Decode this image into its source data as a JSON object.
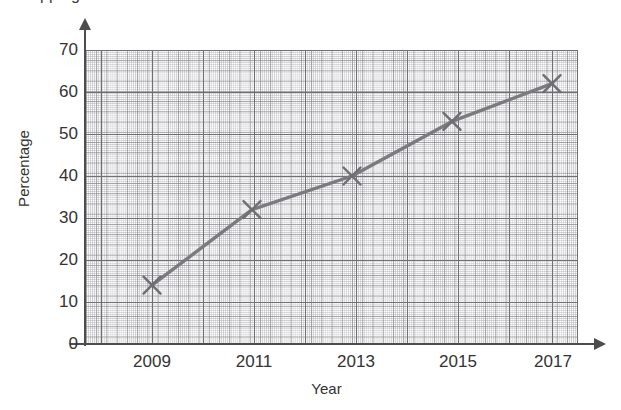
{
  "title": "...pping ... ...",
  "axis": {
    "ylabel": "Percentage",
    "xlabel": "Year"
  },
  "yticks": [
    "0",
    "10",
    "20",
    "30",
    "40",
    "50",
    "60",
    "70"
  ],
  "xticks": [
    "2009",
    "2011",
    "2013",
    "2015",
    "2017"
  ],
  "colors": {
    "line": "#7a7a7f",
    "marker": "#6e6e73",
    "axis": "#4d4d4d",
    "grid_major": "#6f6f74",
    "grid_minor": "#96969e",
    "text": "#333333"
  },
  "chart_data": {
    "type": "line",
    "title": "",
    "xlabel": "Year",
    "ylabel": "Percentage",
    "x": [
      2009,
      2011,
      2013,
      2015,
      2017
    ],
    "xtick_labels": [
      "2009",
      "2011",
      "2013",
      "2015",
      "2017"
    ],
    "values": [
      14,
      32,
      40,
      53,
      62
    ],
    "series": [
      {
        "name": "Percentage",
        "values": [
          14,
          32,
          40,
          53,
          62
        ]
      }
    ],
    "ylim": [
      0,
      70
    ],
    "ytick_labels": [
      "0",
      "10",
      "20",
      "30",
      "40",
      "50",
      "60",
      "70"
    ],
    "ytick_step": 10,
    "grid": true,
    "grid_style": "graph-paper (fine 2px minor, 10px medium, major at tick values)",
    "marker": "x",
    "legend": "none",
    "annotations": []
  }
}
